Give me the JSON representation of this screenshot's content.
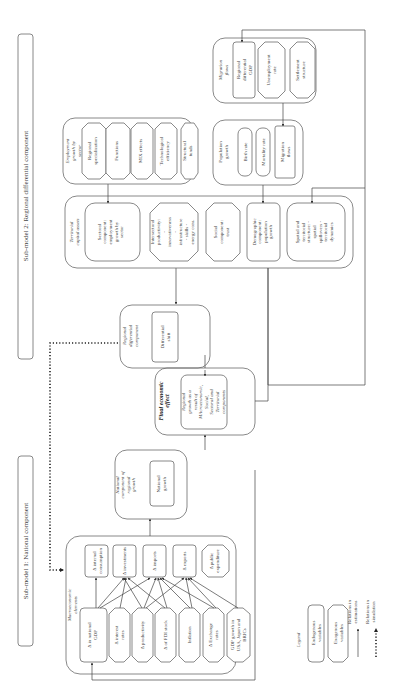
{
  "submodels": {
    "national": "Sub-model 1: National component",
    "regional": "Sub-model 2: Regional differential component"
  },
  "macroeconomic": {
    "title": "Macroeconomic elements",
    "drivers": [
      "Δ in national GDP",
      "Δ interest rates",
      "Δ productivity",
      "Δ of FDI stock",
      "Inflation",
      "Δ Exchange rates",
      "GDP growth in USA, Japan and BRICs"
    ],
    "outcomes": [
      "Δ internal consumption",
      "Δ investments",
      "Δ imports",
      "Δ exports",
      "Δ public expenditure"
    ]
  },
  "national_component": {
    "title": "National component of regional growth",
    "inner": "National growth"
  },
  "final_effect": {
    "title": "Final economic effect",
    "inner": "Regional growth as a result of MAcroeconomic, Social, Sectoral and Territorial components"
  },
  "regional_differential": {
    "title": "Regional differential component",
    "inner": "Differential shift"
  },
  "territorial_capital": {
    "title": "Territorial capital assets",
    "items": [
      "Sectoral component: employment growth by sector",
      "Intersectoral productivity: - innovativeness - infrastructure - skills - energy cons.",
      "Social component: trust",
      "Demographic component: population growth",
      "Spatial and territorial structure: - spatial spillovers - territorial dynamics"
    ]
  },
  "employment_growth": {
    "title": "Employment growth by sector",
    "items": [
      "Regional specialization",
      "Functions",
      "MIX effects",
      "Technological efficiency",
      "Structural funds"
    ]
  },
  "population_growth": {
    "title": "Population growth",
    "items": [
      "Birth rate",
      "Mortality rate",
      "Migration flows"
    ]
  },
  "migration_flows": {
    "title": "Migration flows",
    "items": [
      "Regional differential GDP",
      "Unemployment rate",
      "Settlement structure"
    ]
  },
  "legend": {
    "title": "Legend",
    "endogenous": "Endogenous variables",
    "exogenous": "Exogenous variables",
    "estimation": "Relations in estimations",
    "simulation": "Relations in simulation"
  }
}
